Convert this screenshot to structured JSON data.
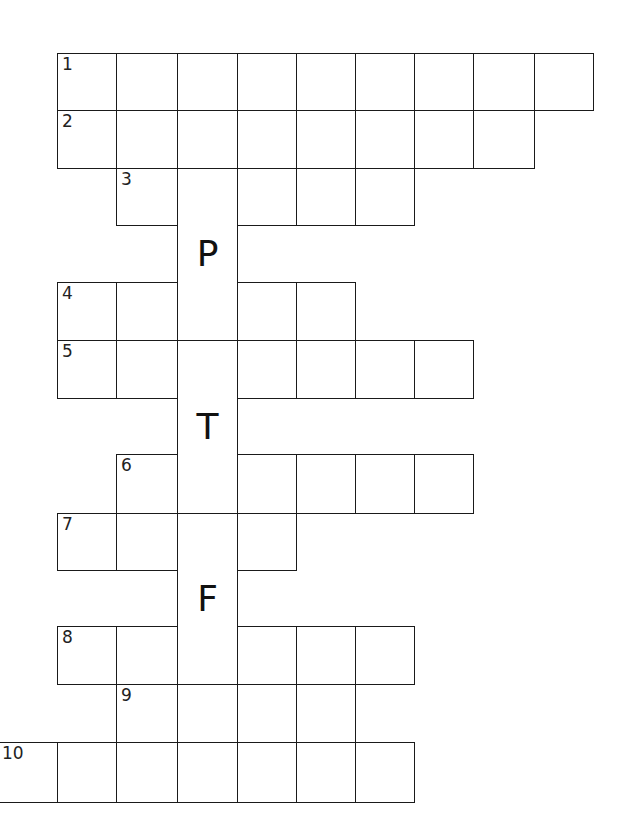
{
  "puzzle": {
    "type": "crossword",
    "geometry": {
      "col_edges": [
        -2,
        57,
        116,
        177,
        237,
        296,
        355,
        414,
        473,
        534,
        593
      ],
      "row_edges": [
        53,
        110,
        168,
        225,
        282,
        340,
        398,
        454,
        513,
        570,
        626,
        684,
        742,
        802
      ]
    },
    "rows": [
      {
        "number": "1",
        "row_index": 0,
        "start_col": 1,
        "length": 9
      },
      {
        "number": "2",
        "row_index": 1,
        "start_col": 1,
        "length": 8
      },
      {
        "number": "3",
        "row_index": 2,
        "start_col": 2,
        "length": 5
      },
      {
        "number": "4",
        "row_index": 4,
        "start_col": 1,
        "length": 5
      },
      {
        "number": "5",
        "row_index": 5,
        "start_col": 1,
        "length": 7
      },
      {
        "number": "6",
        "row_index": 7,
        "start_col": 2,
        "length": 6
      },
      {
        "number": "7",
        "row_index": 8,
        "start_col": 1,
        "length": 4
      },
      {
        "number": "8",
        "row_index": 10,
        "start_col": 1,
        "length": 6
      },
      {
        "number": "9",
        "row_index": 11,
        "start_col": 2,
        "length": 4
      },
      {
        "number": "10",
        "row_index": 12,
        "start_col": 0,
        "length": 7
      }
    ],
    "given_letters": [
      {
        "letter": "P",
        "row_index": 3,
        "col": 3
      },
      {
        "letter": "T",
        "row_index": 6,
        "col": 3
      },
      {
        "letter": "F",
        "row_index": 9,
        "col": 3
      }
    ],
    "vertical_word_column": 3
  }
}
